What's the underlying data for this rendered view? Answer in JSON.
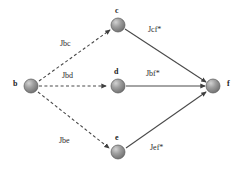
{
  "diagram": {
    "title": "",
    "background_color": "#ffffff",
    "node_fill_color": "#8c8c8c",
    "node_highlight_color": "#c9c9c9",
    "node_stroke_color": "#555555",
    "edge_color": "#4a4a4a",
    "label_color": "#222222",
    "nodes": [
      {
        "id": "b",
        "label": "b",
        "cx": 31,
        "cy": 86,
        "r": 7,
        "label_x": 13,
        "label_y": 82
      },
      {
        "id": "c",
        "label": "c",
        "cx": 118,
        "cy": 25,
        "r": 7,
        "label_x": 115,
        "label_y": 9
      },
      {
        "id": "d",
        "label": "d",
        "cx": 118,
        "cy": 86,
        "r": 7,
        "label_x": 114,
        "label_y": 70
      },
      {
        "id": "e",
        "label": "e",
        "cx": 118,
        "cy": 152,
        "r": 7,
        "label_x": 115,
        "label_y": 136
      },
      {
        "id": "f",
        "label": "f",
        "cx": 213,
        "cy": 86,
        "r": 7,
        "label_x": 227,
        "label_y": 82
      }
    ],
    "edges": [
      {
        "id": "b-c",
        "from": "b",
        "to": "c",
        "style": "dashed",
        "label": "Jbc",
        "label_x": 60,
        "label_y": 42,
        "x1": 39,
        "y1": 81,
        "x2": 110,
        "y2": 30
      },
      {
        "id": "b-d",
        "from": "b",
        "to": "d",
        "style": "dashed",
        "label": "Jbd",
        "label_x": 62,
        "label_y": 74,
        "x1": 39,
        "y1": 86,
        "x2": 109,
        "y2": 86
      },
      {
        "id": "b-e",
        "from": "b",
        "to": "e",
        "style": "dashed",
        "label": "Jbe",
        "label_x": 59,
        "label_y": 139,
        "x1": 38,
        "y1": 92,
        "x2": 109,
        "y2": 148
      },
      {
        "id": "c-f",
        "from": "c",
        "to": "f",
        "style": "solid",
        "label": "Jcf*",
        "label_x": 148,
        "label_y": 28,
        "x1": 125,
        "y1": 29,
        "x2": 206,
        "y2": 82
      },
      {
        "id": "d-f",
        "from": "d",
        "to": "f",
        "style": "solid",
        "label": "Jbf*",
        "label_x": 146,
        "label_y": 72,
        "x1": 126,
        "y1": 86,
        "x2": 205,
        "y2": 86
      },
      {
        "id": "e-f",
        "from": "e",
        "to": "f",
        "style": "solid",
        "label": "Jef*",
        "label_x": 150,
        "label_y": 146,
        "x1": 126,
        "y1": 148,
        "x2": 206,
        "y2": 92
      }
    ]
  }
}
